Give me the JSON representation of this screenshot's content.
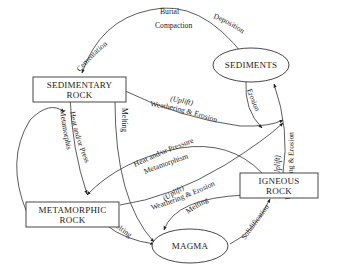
{
  "nodes": {
    "sedimentary": {
      "line1": "SEDIMENTARY",
      "line2": "ROCK"
    },
    "sediments": {
      "line1": "SEDIMENTS"
    },
    "metamorphic": {
      "line1": "METAMORPHIC",
      "line2": "ROCK"
    },
    "igneous": {
      "line1": "IGNEOUS",
      "line2": "ROCK"
    },
    "magma": {
      "line1": "MAGMA"
    }
  },
  "edges": {
    "cementation": "Cementation",
    "burial": "Burial",
    "compaction": "Compaction",
    "deposition": "Deposition",
    "erosion": "Erosion",
    "sed_to_sediments_uplift": "(Uplift)",
    "sed_to_sediments_weathering": "Weathering & Erosion",
    "sed_to_meta_heat": "Heat and/or Pressure",
    "sed_to_meta_metamorphism": "Metamorphism",
    "sed_melting": "Melting",
    "ign_to_meta_heat": "Heat and/or Pressure",
    "ign_to_meta_metamorphism": "Metamorphism",
    "meta_to_sediments_uplift": "(Uplift)",
    "meta_to_sediments_weathering": "Weathering & Erosion",
    "ign_to_sediments_uplift": "(Uplift)",
    "ign_to_sediments_weathering": "Weathering & Erosion",
    "ign_melting": "Melting",
    "solidification": "Solidification",
    "meta_melting": "Melting"
  }
}
